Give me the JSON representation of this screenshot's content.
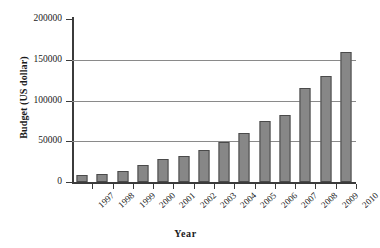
{
  "chart_data": {
    "type": "bar",
    "title": "",
    "xlabel": "Year",
    "ylabel": "Budget (US dollar)",
    "categories": [
      "1997",
      "1998",
      "1999",
      "2000",
      "2001",
      "2002",
      "2003",
      "2004",
      "2005",
      "2006",
      "2007",
      "2008",
      "2009",
      "2010"
    ],
    "values": [
      8000,
      10000,
      14000,
      21000,
      28000,
      32000,
      39000,
      49000,
      60000,
      75000,
      82000,
      115000,
      130000,
      160000
    ],
    "ylim": [
      0,
      200000
    ],
    "yticks": [
      0,
      50000,
      100000,
      150000,
      200000
    ],
    "ytick_labels": [
      "0",
      "50000",
      "100000",
      "150000",
      "200000"
    ],
    "grid": true,
    "legend": "none",
    "series": [
      {
        "name": "Budget",
        "values": [
          8000,
          10000,
          14000,
          21000,
          28000,
          32000,
          39000,
          49000,
          60000,
          75000,
          82000,
          115000,
          130000,
          160000
        ]
      }
    ],
    "colors": {
      "bar_fill": "#878787",
      "bar_border": "#4a4a4a",
      "gridline": "#8a8a8a",
      "axis": "#3b3b3b",
      "background": "#ffffff",
      "text": "#1a1a1a"
    }
  }
}
